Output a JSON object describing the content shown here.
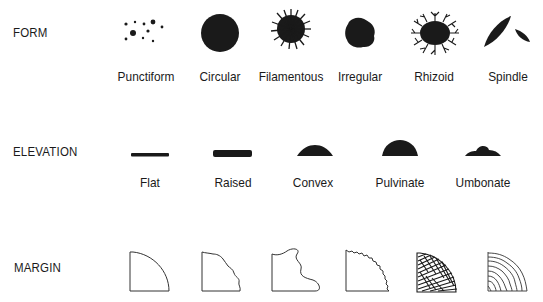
{
  "rows": {
    "form": {
      "label": "FORM",
      "items": [
        {
          "name": "Punctiform"
        },
        {
          "name": "Circular"
        },
        {
          "name": "Filamentous"
        },
        {
          "name": "Irregular"
        },
        {
          "name": "Rhizoid"
        },
        {
          "name": "Spindle"
        }
      ]
    },
    "elevation": {
      "label": "ELEVATION",
      "items": [
        {
          "name": "Flat"
        },
        {
          "name": "Raised"
        },
        {
          "name": "Convex"
        },
        {
          "name": "Pulvinate"
        },
        {
          "name": "Umbonate"
        }
      ]
    },
    "margin": {
      "label": "MARGIN",
      "items": [
        {
          "name": "Entire"
        },
        {
          "name": "Undulate"
        },
        {
          "name": "Lobate"
        },
        {
          "name": "Serrate"
        },
        {
          "name": "Filamentous"
        },
        {
          "name": "Curled"
        }
      ]
    }
  },
  "colors": {
    "ink": "#1a1a1a",
    "background": "#ffffff"
  }
}
